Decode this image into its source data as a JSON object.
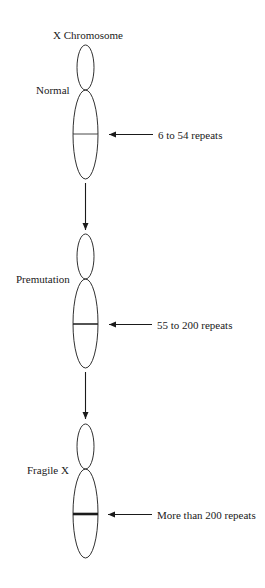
{
  "title": "X Chromosome",
  "stages": [
    {
      "name": "Normal",
      "repeats_label": "6 to 54 repeats",
      "band": "thin"
    },
    {
      "name": "Premutation",
      "repeats_label": "55 to 200 repeats",
      "band": "medium"
    },
    {
      "name": "Fragile X",
      "repeats_label": "More than 200 repeats",
      "band": "thick"
    }
  ],
  "colors": {
    "line": "#1a1a1a",
    "background": "#ffffff"
  }
}
